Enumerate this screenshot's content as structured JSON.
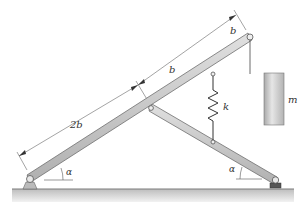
{
  "figure": {
    "type": "mechanism-diagram",
    "labels": {
      "dim_long": "2b",
      "dim_mid": "b",
      "dim_top": "b",
      "spring": "k",
      "mass": "m",
      "angle_left": "α",
      "angle_right": "α"
    },
    "colors": {
      "bar_fill": "#c9c9c9",
      "bar_edge": "#6e6e6e",
      "ground_top": "#9a9a9a",
      "ground_fill": "#d8d8d8",
      "mass_fill": "#cfcfcf",
      "line": "#555555"
    }
  }
}
